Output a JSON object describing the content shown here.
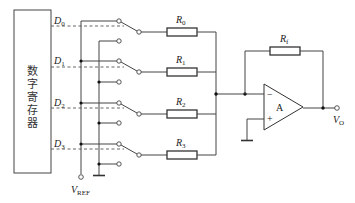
{
  "diagram": {
    "type": "R-2R style weighted-resistor D/A converter (inverted summing amplifier)",
    "register": {
      "label_chars": [
        "数",
        "字",
        "寄",
        "存",
        "器"
      ]
    },
    "bits": [
      {
        "label": "D",
        "sub": "0"
      },
      {
        "label": "D",
        "sub": "1"
      },
      {
        "label": "D",
        "sub": "2"
      },
      {
        "label": "D",
        "sub": "3"
      }
    ],
    "resistors": [
      {
        "label": "R",
        "sub": "0"
      },
      {
        "label": "R",
        "sub": "1"
      },
      {
        "label": "R",
        "sub": "2"
      },
      {
        "label": "R",
        "sub": "3"
      }
    ],
    "feedback_resistor": {
      "label": "R",
      "sub": "f"
    },
    "opamp": {
      "label": "A",
      "inverting_sign": "−",
      "noninverting_sign": "+"
    },
    "reference": {
      "label": "V",
      "sub": "REF"
    },
    "output": {
      "label": "V",
      "sub": "O"
    },
    "colors": {
      "line": "#444444",
      "background": "#ffffff"
    }
  }
}
